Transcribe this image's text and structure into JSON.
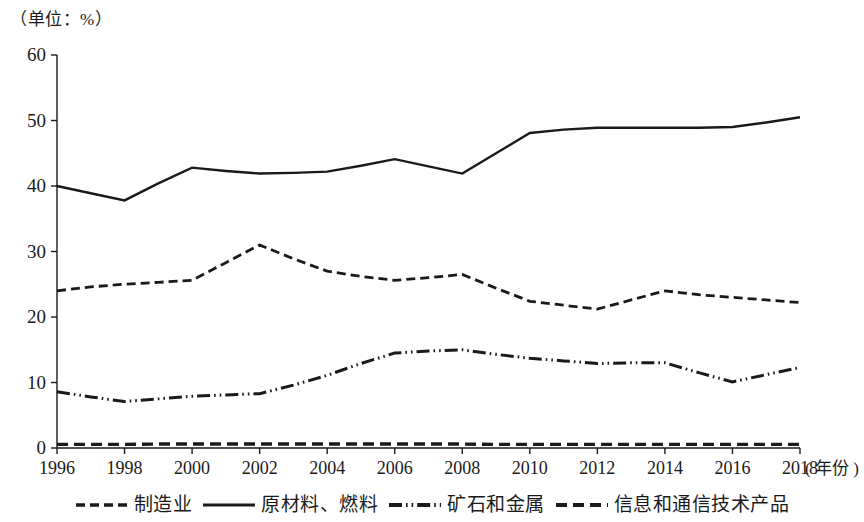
{
  "unit_label": "（单位：%）",
  "x_axis_unit": "( 年份 )",
  "legend": {
    "items": [
      {
        "label": "制造业",
        "style": "dashed",
        "swatch": "legend-swatch-manufacturing"
      },
      {
        "label": "原材料、燃料",
        "style": "solid",
        "swatch": "legend-swatch-raw-materials"
      },
      {
        "label": "矿石和金属",
        "style": "dash-dot-dot",
        "swatch": "legend-swatch-ores-metals"
      },
      {
        "label": "信息和通信技术产品",
        "style": "long-dash",
        "swatch": "legend-swatch-ict"
      }
    ]
  },
  "chart_data": {
    "type": "line",
    "title": "",
    "subtitle": "",
    "xlabel": "年份",
    "ylabel": "%",
    "unit": "%",
    "grid": false,
    "legend_position": "bottom",
    "xlim": [
      1996,
      2018
    ],
    "ylim": [
      0,
      60
    ],
    "ytick_labels": [
      "0",
      "10",
      "20",
      "30",
      "40",
      "50",
      "60"
    ],
    "yticks": [
      0,
      10,
      20,
      30,
      40,
      50,
      60
    ],
    "xtick_labels": [
      "1996",
      "1998",
      "2000",
      "2002",
      "2004",
      "2006",
      "2008",
      "2010",
      "2012",
      "2014",
      "2016",
      "2018"
    ],
    "xticks": [
      1996,
      1998,
      2000,
      2002,
      2004,
      2006,
      2008,
      2010,
      2012,
      2014,
      2016,
      2018
    ],
    "x": [
      1996,
      1997,
      1998,
      1999,
      2000,
      2001,
      2002,
      2003,
      2004,
      2005,
      2006,
      2007,
      2008,
      2009,
      2010,
      2011,
      2012,
      2013,
      2014,
      2015,
      2016,
      2017,
      2018
    ],
    "series": [
      {
        "name": "原材料、燃料",
        "style": "solid",
        "values": [
          40.0,
          38.9,
          37.8,
          40.4,
          42.8,
          42.3,
          41.9,
          42.0,
          42.2,
          43.1,
          44.1,
          43.0,
          41.9,
          45.0,
          48.1,
          48.6,
          48.9,
          48.9,
          48.9,
          48.9,
          49.0,
          49.7,
          50.5
        ]
      },
      {
        "name": "制造业",
        "style": "dashed",
        "values": [
          24.0,
          24.6,
          25.0,
          25.3,
          25.6,
          28.3,
          31.0,
          28.9,
          27.0,
          26.2,
          25.6,
          26.0,
          26.5,
          24.4,
          22.4,
          21.8,
          21.2,
          22.6,
          24.0,
          23.4,
          23.0,
          22.6,
          22.2
        ]
      },
      {
        "name": "矿石和金属",
        "style": "dash-dot-dot",
        "values": [
          8.6,
          7.8,
          7.1,
          7.5,
          7.9,
          8.1,
          8.3,
          9.6,
          11.1,
          12.9,
          14.5,
          14.8,
          15.0,
          14.3,
          13.7,
          13.3,
          12.9,
          13.0,
          13.0,
          11.5,
          10.1,
          11.2,
          12.3
        ]
      },
      {
        "name": "信息和通信技术产品",
        "style": "long-dash",
        "values": [
          0.55,
          0.55,
          0.55,
          0.6,
          0.6,
          0.6,
          0.6,
          0.6,
          0.6,
          0.6,
          0.6,
          0.6,
          0.6,
          0.55,
          0.55,
          0.55,
          0.55,
          0.55,
          0.55,
          0.55,
          0.55,
          0.55,
          0.55
        ]
      }
    ]
  }
}
